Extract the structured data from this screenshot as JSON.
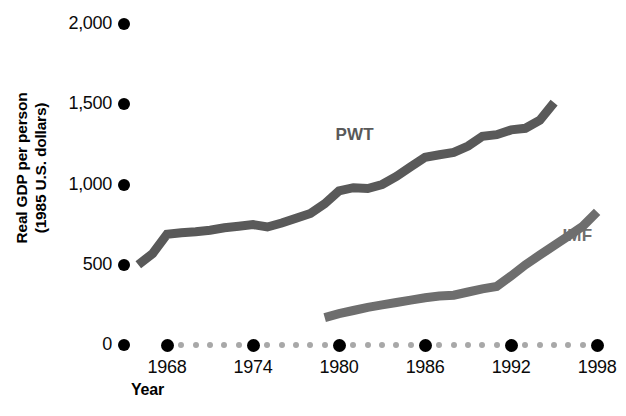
{
  "chart_data": {
    "type": "line",
    "title": "",
    "xlabel": "Year",
    "ylabel": "Real GDP per person\n(1985 U.S. dollars)",
    "ylim": [
      0,
      2000
    ],
    "xlim": [
      1965,
      1999
    ],
    "yticks": [
      0,
      500,
      1000,
      1500,
      2000
    ],
    "ytick_labels": [
      "0",
      "500",
      "1,000",
      "1,500",
      "2,000"
    ],
    "xticks": [
      1968,
      1974,
      1980,
      1986,
      1992,
      1998
    ],
    "xtick_labels": [
      "1968",
      "1974",
      "1980",
      "1986",
      "1992",
      "1998"
    ],
    "grid": false,
    "legend_position": "inline-annotations",
    "series": [
      {
        "name": "PWT",
        "color": "#595959",
        "x": [
          1966,
          1967,
          1968,
          1969,
          1970,
          1971,
          1972,
          1973,
          1974,
          1975,
          1976,
          1977,
          1978,
          1979,
          1980,
          1981,
          1982,
          1983,
          1984,
          1985,
          1986,
          1987,
          1988,
          1989,
          1990,
          1991,
          1992,
          1993,
          1994,
          1995
        ],
        "values": [
          500,
          570,
          690,
          700,
          705,
          715,
          730,
          740,
          750,
          735,
          760,
          790,
          820,
          880,
          960,
          980,
          975,
          1000,
          1050,
          1110,
          1170,
          1185,
          1200,
          1240,
          1300,
          1310,
          1340,
          1350,
          1400,
          1510
        ]
      },
      {
        "name": "IMF",
        "color": "#6e6e6e",
        "x": [
          1979,
          1980,
          1981,
          1982,
          1983,
          1984,
          1985,
          1986,
          1987,
          1988,
          1989,
          1990,
          1991,
          1992,
          1993,
          1994,
          1995,
          1996,
          1997,
          1998
        ],
        "values": [
          170,
          195,
          215,
          235,
          250,
          265,
          280,
          295,
          305,
          310,
          330,
          350,
          365,
          430,
          500,
          560,
          620,
          680,
          740,
          830
        ]
      }
    ],
    "annotations": [
      {
        "text": "PWT",
        "x": 1981,
        "y": 1310
      },
      {
        "text": "IMF",
        "x": 1996,
        "y": 680
      }
    ]
  },
  "axis": {
    "y_title": "Real GDP per person\n(1985 U.S. dollars)",
    "x_title": "Year",
    "y_labels": [
      "2,000",
      "1,500",
      "1,000",
      "500",
      "0"
    ],
    "x_labels": [
      "1968",
      "1974",
      "1980",
      "1986",
      "1992",
      "1998"
    ]
  },
  "colors": {
    "pwt_line": "#595959",
    "imf_line": "#6e6e6e",
    "tick_major": "#000000",
    "tick_minor": "#a8a8a8",
    "text": "#000000",
    "background": "#ffffff"
  }
}
